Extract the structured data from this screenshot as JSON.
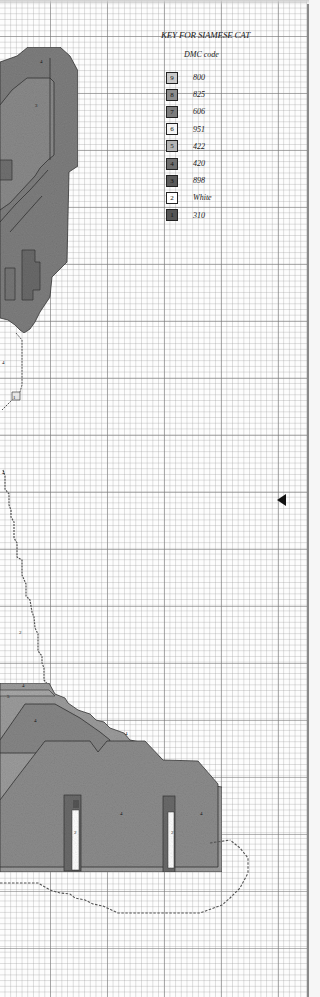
{
  "page": {
    "background": "#fdfdfd",
    "grid": {
      "minor_cell_px": 5.7,
      "major_every": 10,
      "major_color": "#888888",
      "minor_color": "#bbbbbb"
    }
  },
  "key": {
    "title": "KEY  FOR SIAMESE CAT",
    "subtitle": "DMC code",
    "items": [
      {
        "symbol": "9",
        "code": "800",
        "color": "#c9c9c9"
      },
      {
        "symbol": "8",
        "code": "825",
        "color": "#8d8d8d"
      },
      {
        "symbol": "7",
        "code": "606",
        "color": "#7c7c7c"
      },
      {
        "symbol": "6",
        "code": "951",
        "color": "#f4f4f4"
      },
      {
        "symbol": "5",
        "code": "422",
        "color": "#b4b4b4"
      },
      {
        "symbol": "4",
        "code": "420",
        "color": "#6e6e6e"
      },
      {
        "symbol": "3",
        "code": "898",
        "color": "#5a5a5a"
      },
      {
        "symbol": "2",
        "code": "White",
        "color": "#ffffff"
      },
      {
        "symbol": "1",
        "code": "310",
        "color": "#555555"
      }
    ]
  },
  "pattern": {
    "symbol_labels": [
      {
        "text": "4",
        "x": 40,
        "y": 63
      },
      {
        "text": "3",
        "x": 35,
        "y": 107
      },
      {
        "text": "4",
        "x": 2,
        "y": 364
      },
      {
        "text": "1",
        "x": 13,
        "y": 399
      },
      {
        "text": "4",
        "x": 2,
        "y": 474
      },
      {
        "text": "2",
        "x": 19,
        "y": 634
      },
      {
        "text": "5",
        "x": 7,
        "y": 698
      },
      {
        "text": "4",
        "x": 22,
        "y": 687
      },
      {
        "text": "4",
        "x": 34,
        "y": 722
      },
      {
        "text": "4",
        "x": 125,
        "y": 735
      },
      {
        "text": "2",
        "x": 74,
        "y": 834
      },
      {
        "text": "2",
        "x": 171,
        "y": 834
      },
      {
        "text": "4",
        "x": 120,
        "y": 815
      },
      {
        "text": "4",
        "x": 200,
        "y": 815
      }
    ]
  },
  "page_marker": {
    "type": "arrow-left",
    "color": "#111111"
  }
}
